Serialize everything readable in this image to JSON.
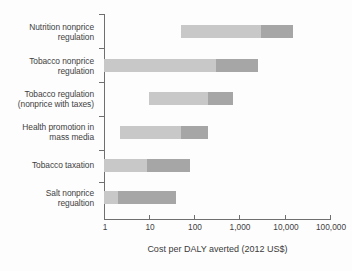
{
  "chart_data": {
    "type": "bar",
    "subtype": "range-bar-log",
    "title": "",
    "xlabel": "Cost per DALY averted (2012 US$)",
    "ylabel": "",
    "xscale": "log",
    "xlim": [
      1,
      100000
    ],
    "xticks": [
      1,
      10,
      100,
      1000,
      10000,
      100000
    ],
    "xtick_labels": [
      "1",
      "10",
      "100",
      "1,000",
      "10,000",
      "100,000"
    ],
    "grid": false,
    "legend": "none",
    "colors": {
      "light_segment": "#c8c8c8",
      "dark_segment": "#a6a6a6",
      "axis": "#6f6f6f",
      "text": "#3f3f3f",
      "background": "#fdfdfd"
    },
    "categories": [
      "Nutrition nonprice\nregulation",
      "Tobacco nonprice\nregulation",
      "Tobacco regulation\n(nonprice with taxes)",
      "Health promotion in\nmass media",
      "Tobacco taxation",
      "Salt nonprice\nregualtion"
    ],
    "series": [
      {
        "name": "Lower range (light)",
        "color": "#c8c8c8",
        "ranges": [
          {
            "start": 50,
            "end": 3000
          },
          {
            "start": 1,
            "end": 300
          },
          {
            "start": 10,
            "end": 200
          },
          {
            "start": 2.3,
            "end": 50
          },
          {
            "start": 1,
            "end": 9
          },
          {
            "start": 1,
            "end": 2
          }
        ]
      },
      {
        "name": "Upper range (dark)",
        "color": "#a6a6a6",
        "ranges": [
          {
            "start": 3000,
            "end": 15000
          },
          {
            "start": 300,
            "end": 2500
          },
          {
            "start": 200,
            "end": 700
          },
          {
            "start": 50,
            "end": 200
          },
          {
            "start": 9,
            "end": 80
          },
          {
            "start": 2,
            "end": 40
          }
        ]
      }
    ]
  },
  "axis": {
    "x_title": "Cost per DALY averted (2012 US$)",
    "tick_labels": [
      "1",
      "10",
      "100",
      "1,000",
      "10,000",
      "100,000"
    ]
  },
  "categories": [
    {
      "label": "Nutrition nonprice\nregulation"
    },
    {
      "label": "Tobacco nonprice\nregulation"
    },
    {
      "label": "Tobacco regulation\n(nonprice with taxes)"
    },
    {
      "label": "Health promotion in\nmass media"
    },
    {
      "label": "Tobacco taxation"
    },
    {
      "label": "Salt nonprice\nregualtion"
    }
  ]
}
